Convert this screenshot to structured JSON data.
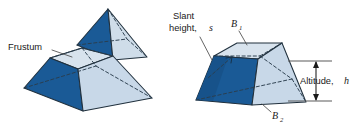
{
  "figure": {
    "background_color": "#ffffff",
    "colors": {
      "face_dark": "#1a5a96",
      "face_dark_shade": "#17528a",
      "face_light": "#c8d8e8",
      "face_light_top": "#d6e2ed",
      "face_mid": "#bdd0e2",
      "edge": "#20303d",
      "hidden_edge": "#2a3d4d",
      "leader": "#4a4a4a",
      "text": "#1a1a1a"
    }
  },
  "labels": {
    "frustum": "Frustum",
    "slant_line1": "Slant",
    "slant_line2": "height,",
    "slant_symbol": "s",
    "base_top_symbol": "B",
    "base_top_subscript": "1",
    "base_bottom_symbol": "B",
    "base_bottom_subscript": "2",
    "altitude": "Altitude,",
    "altitude_symbol": "h"
  },
  "left_figure": {
    "name": "pyramid-split-into-cap-and-frustum",
    "parts": [
      "upper-pyramid-cap",
      "lower-frustum"
    ]
  },
  "right_figure": {
    "name": "labeled-frustum",
    "parts": [
      "top-base-B1",
      "bottom-base-B2",
      "slant-height-s",
      "altitude-h"
    ]
  }
}
